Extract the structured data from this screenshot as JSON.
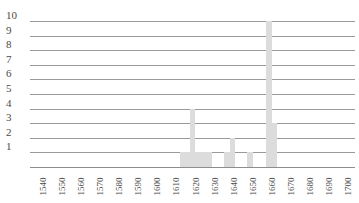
{
  "chart_data": {
    "type": "bar",
    "title": "",
    "subtitle": "",
    "xlabel": "",
    "ylabel": "",
    "grid": true,
    "legend": false,
    "legend_position": "none",
    "xlim": [
      1535,
      1705
    ],
    "ylim": [
      0,
      10
    ],
    "y_ticks": [
      1,
      2,
      3,
      4,
      5,
      6,
      7,
      8,
      9,
      10
    ],
    "x_ticks": [
      1540,
      1550,
      1560,
      1570,
      1580,
      1590,
      1600,
      1610,
      1620,
      1630,
      1640,
      1650,
      1660,
      1670,
      1680,
      1690,
      1700
    ],
    "bar_color": "#dcdcdc",
    "gridline_color": "#9a9a9a",
    "axis_color": "#8d8d8d",
    "text_color": "#4a4a4a",
    "categories": [
      1615,
      1617,
      1620,
      1623,
      1626,
      1629,
      1638,
      1641,
      1650,
      1660,
      1663
    ],
    "values": [
      1,
      1,
      4,
      1,
      1,
      1,
      1,
      2,
      1,
      10,
      3
    ],
    "bars": [
      {
        "x": 1615,
        "y": 1
      },
      {
        "x": 1617,
        "y": 1
      },
      {
        "x": 1620,
        "y": 4
      },
      {
        "x": 1623,
        "y": 1
      },
      {
        "x": 1626,
        "y": 1
      },
      {
        "x": 1629,
        "y": 1
      },
      {
        "x": 1638,
        "y": 1
      },
      {
        "x": 1641,
        "y": 2
      },
      {
        "x": 1650,
        "y": 1
      },
      {
        "x": 1660,
        "y": 10
      },
      {
        "x": 1663,
        "y": 3
      }
    ]
  }
}
